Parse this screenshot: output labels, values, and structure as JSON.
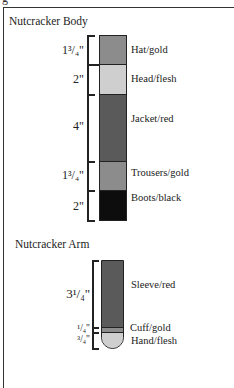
{
  "header_fragment": "g",
  "body_section": {
    "title": "Nutcracker Body",
    "segments": [
      {
        "dimension": "1³/₄\"",
        "label": "Hat/gold",
        "color": "#8c8c8c"
      },
      {
        "dimension": "2\"",
        "label": "Head/flesh",
        "color": "#cfcfcf"
      },
      {
        "dimension": "4\"",
        "label": "Jacket/red",
        "color": "#5a5a5a"
      },
      {
        "dimension": "1³/₄\"",
        "label": "Trousers/gold",
        "color": "#8c8c8c"
      },
      {
        "dimension": "2\"",
        "label": "Boots/black",
        "color": "#0d0d0d"
      }
    ]
  },
  "arm_section": {
    "title": "Nutcracker Arm",
    "segments": [
      {
        "dimension": "3¹/₄\"",
        "label": "Sleeve/red",
        "color": "#5a5a5a"
      },
      {
        "dimension": "¹/₄\"",
        "label": "Cuff/gold",
        "color": "#8c8c8c"
      },
      {
        "dimension": "³/₄\"",
        "label": "Hand/flesh",
        "color": "#cfcfcf"
      }
    ]
  }
}
